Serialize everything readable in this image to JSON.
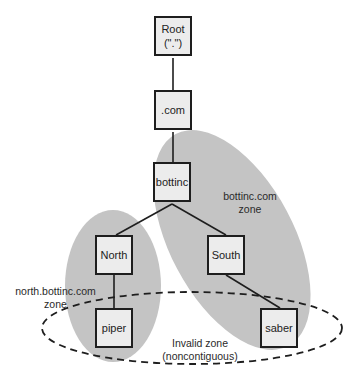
{
  "diagram": {
    "type": "tree",
    "colors": {
      "zone_fill": "#c4c4c4",
      "node_fill": "#ececec",
      "stroke": "#1e1e1e"
    },
    "nodes": {
      "root": {
        "line1": "Root",
        "line2": "(\".\")"
      },
      "com": "",
      "bottinc": "bottinc",
      "north": "North",
      "south": "South",
      "piper": "piper",
      "saber": "saber"
    },
    "node_com_label": ".com",
    "edges": [
      [
        "Root",
        ".com"
      ],
      [
        ".com",
        "bottinc"
      ],
      [
        "bottinc",
        "North"
      ],
      [
        "bottinc",
        "South"
      ],
      [
        "North",
        "piper"
      ],
      [
        "South",
        "saber"
      ]
    ],
    "zones": {
      "bottinc": {
        "line1": "bottinc.com",
        "line2": "zone"
      },
      "north": {
        "line1": "north.bottinc.com",
        "line2": "zone"
      },
      "invalid": {
        "line1": "Invalid zone",
        "line2": "(noncontiguous)"
      }
    }
  }
}
